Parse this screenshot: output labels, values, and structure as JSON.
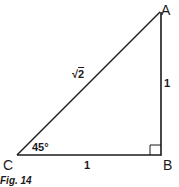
{
  "figure": {
    "caption": "Fig. 14",
    "colors": {
      "stroke": "#1a1a1a",
      "background": "#ffffff"
    },
    "vertices": {
      "A": {
        "label": "A",
        "x": 160,
        "y": 12
      },
      "B": {
        "label": "B",
        "x": 161,
        "y": 155
      },
      "C": {
        "label": "C",
        "x": 17,
        "y": 155
      }
    },
    "sides": {
      "hypotenuse_CA": {
        "symbol": "√",
        "radicand": "2"
      },
      "vertical_AB": {
        "label": "1"
      },
      "horizontal_CB": {
        "label": "1"
      }
    },
    "angles": {
      "C": {
        "label": "45°"
      },
      "B": {
        "marker": "right-angle"
      }
    }
  }
}
